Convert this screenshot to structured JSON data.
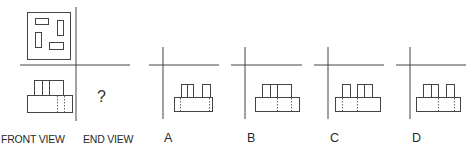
{
  "labels": {
    "front_view": "FRONT VIEW",
    "end_view": "END VIEW",
    "question_mark": "?"
  },
  "options": [
    {
      "id": "A",
      "label": "A"
    },
    {
      "id": "B",
      "label": "B"
    },
    {
      "id": "C",
      "label": "C"
    },
    {
      "id": "D",
      "label": "D"
    }
  ],
  "colors": {
    "stroke": "#444444",
    "dashed": "#666666",
    "background": "#ffffff"
  }
}
